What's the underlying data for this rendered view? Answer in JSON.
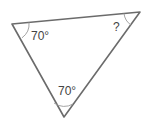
{
  "diagram": {
    "type": "triangle",
    "angles": [
      {
        "vertex": "left",
        "label": "70°"
      },
      {
        "vertex": "top-right",
        "label": "?"
      },
      {
        "vertex": "bottom",
        "label": "70°"
      }
    ],
    "colors": {
      "stroke": "#6b6b6b",
      "arc": "#9a9a9a",
      "text": "#444444"
    }
  }
}
